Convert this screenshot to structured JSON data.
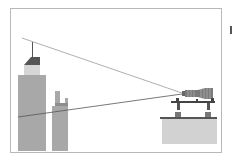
{
  "diagram": {
    "type": "line-of-sight illustration",
    "colors": {
      "background": "#ffffff",
      "frame": "#b8b8b8",
      "building": "#a8a8a8",
      "building_light": "#d6d6d6",
      "roof": "#555555",
      "sight_line_top": "#9a9a9a",
      "sight_line_bottom": "#555555",
      "platform": "#d2d2d2",
      "platform_top": "#555555",
      "lens": "#7a7a7a",
      "rail": "#444444"
    },
    "elements": [
      {
        "id": "tall-building",
        "label": "Skyscraper with spire"
      },
      {
        "id": "short-building",
        "label": "Stepped building"
      },
      {
        "id": "sight-line-top",
        "label": "Upper line of sight"
      },
      {
        "id": "sight-line-bottom",
        "label": "Lower line of sight"
      },
      {
        "id": "telescope",
        "label": "Telescope lens"
      },
      {
        "id": "mount-rail",
        "label": "Mount rail with supports"
      },
      {
        "id": "platform",
        "label": "Platform block"
      }
    ]
  }
}
